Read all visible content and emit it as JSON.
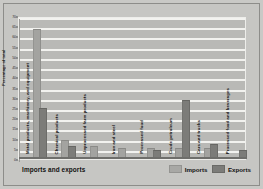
{
  "figure": {
    "x_axis_title": "Imports and exports",
    "y_axis_title": "Percentage of total"
  },
  "legend": {
    "imports_label": "Imports",
    "exports_label": "Exports"
  },
  "colors": {
    "imports": "#a3a3a0",
    "exports": "#7c7c79",
    "plot_background": "#b9b9b6",
    "gridline": "#f2f2ef",
    "page_background": "#c6c6c3"
  },
  "chart_data": {
    "type": "bar",
    "title": "",
    "xlabel": "Imports and exports",
    "ylabel": "Percentage of total",
    "ylim": [
      0,
      70
    ],
    "yticks": [
      0,
      5,
      10,
      15,
      20,
      25,
      30,
      35,
      40,
      45,
      50,
      55,
      60,
      65,
      70
    ],
    "ytick_labels": [
      "0",
      "5",
      "10",
      "15",
      "20",
      "25",
      "30",
      "35",
      "40",
      "45",
      "50",
      "55",
      "60",
      "65",
      "70"
    ],
    "grid": true,
    "legend_position": "bottom-right",
    "categories": [
      "Metal products, machinery, and equipment",
      "Chemical products",
      "Unprocessed farm products",
      "Iron and steel",
      "Processed food",
      "Crude petroleum",
      "Cars and trucks",
      "Processed food and beverages"
    ],
    "series": [
      {
        "name": "Imports",
        "values": [
          63,
          8,
          5,
          4,
          4,
          4,
          4,
          0
        ]
      },
      {
        "name": "Exports",
        "values": [
          24,
          5,
          0,
          0,
          3,
          28,
          6,
          3
        ]
      }
    ]
  }
}
